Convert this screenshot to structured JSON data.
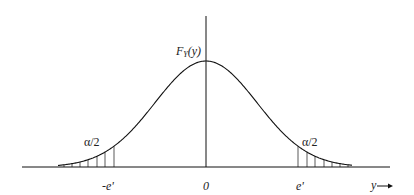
{
  "diagram": {
    "title": "",
    "y_axis_label": "F",
    "y_axis_label_sub": "Y",
    "y_axis_label_arg": "(y)",
    "x_axis_label": "y",
    "tick_labels": {
      "left": "-e'",
      "center": "0",
      "right": "e'"
    },
    "tail_labels": {
      "left": "α/2",
      "right": "α/2"
    },
    "curve": "normal density, symmetric about 0",
    "shaded_regions": [
      "y < -e'",
      "y > e'"
    ],
    "colors": {
      "line": "#111111",
      "background": "#ffffff"
    }
  }
}
